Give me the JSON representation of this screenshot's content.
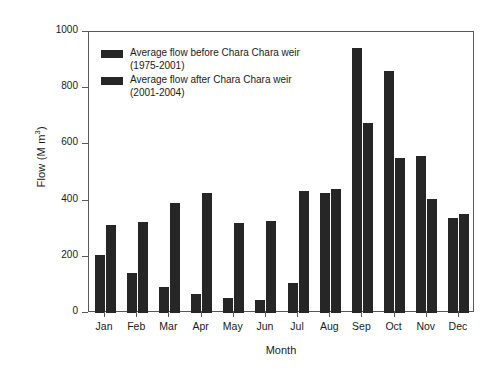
{
  "chart_data": {
    "type": "bar",
    "title": "",
    "xlabel": "Month",
    "ylabel": "Flow (M m3)",
    "ylabel_base": "Flow (M m",
    "ylabel_sup": "3",
    "ylabel_tail": ")",
    "ylim": [
      0,
      1000
    ],
    "yticks": [
      0,
      200,
      400,
      600,
      800,
      1000
    ],
    "ytick_labels": [
      "0",
      "200",
      "400",
      "600",
      "800",
      "1000"
    ],
    "grid": false,
    "legend_position": "upper-left-inside",
    "categories": [
      "Jan",
      "Feb",
      "Mar",
      "Apr",
      "May",
      "Jun",
      "Jul",
      "Aug",
      "Sep",
      "Oct",
      "Nov",
      "Dec"
    ],
    "series": [
      {
        "name": "Average flow before Chara Chara weir (1975-2001)",
        "label_line1": "Average flow before Chara Chara weir",
        "label_line2": "(1975-2001)",
        "color": "#262626",
        "values": [
          206,
          142,
          92,
          67,
          53,
          46,
          106,
          426,
          943,
          862,
          557,
          337
        ]
      },
      {
        "name": "Average flow after Chara Chara weir (2001-2004)",
        "label_line1": "Average flow after Chara Chara weir",
        "label_line2": "(2001-2004)",
        "color": "#262626",
        "values": [
          312,
          323,
          390,
          426,
          319,
          326,
          433,
          440,
          677,
          550,
          404,
          351
        ]
      }
    ]
  },
  "axis": {
    "frame_color": "#5a5a5a"
  }
}
